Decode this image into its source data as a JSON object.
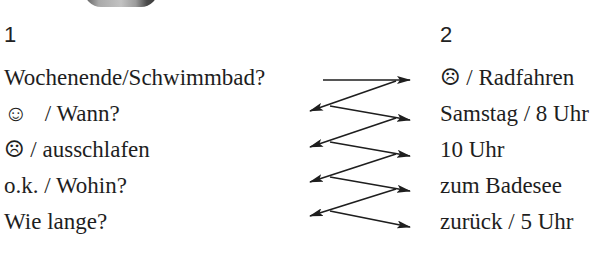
{
  "exercise": {
    "column_1": {
      "number": "1",
      "items": [
        "Wochenende/Schwimmbad?",
        "☺   / Wann?",
        "☹ / ausschlafen",
        "o.k. / Wohin?",
        "Wie lange?"
      ]
    },
    "column_2": {
      "number": "2",
      "items": [
        "☹ / Radfahren",
        "Samstag / 8 Uhr",
        "10 Uhr",
        "zum Badesee",
        "zurück / 5 Uhr"
      ]
    },
    "connector": {
      "type": "zigzag-arrows",
      "color": "#1e1e1e"
    }
  }
}
